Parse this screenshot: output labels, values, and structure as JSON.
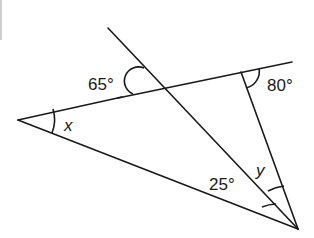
{
  "diagram": {
    "type": "geometry-angles",
    "labels": {
      "angle_top_left": "65°",
      "angle_top_right": "80°",
      "angle_bottom": "25°",
      "var_left": "x",
      "var_bottom": "y"
    },
    "colors": {
      "stroke": "#1a1a1a",
      "background": "#ffffff"
    }
  }
}
